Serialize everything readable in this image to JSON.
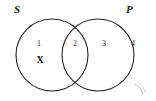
{
  "diagram": {
    "type": "venn-diagram",
    "title": "",
    "sets": [
      {
        "id": "S",
        "label": "S",
        "position": "left"
      },
      {
        "id": "P",
        "label": "P",
        "position": "right"
      }
    ],
    "regions": [
      {
        "id": "region-1",
        "number": "1",
        "meaning": "S only",
        "mark": "X"
      },
      {
        "id": "region-2",
        "number": "2",
        "meaning": "S and P intersection",
        "mark": ""
      },
      {
        "id": "region-3",
        "number": "3",
        "meaning": "P only",
        "mark": ""
      },
      {
        "id": "region-4",
        "number": "4",
        "meaning": "outside both sets",
        "mark": ""
      }
    ],
    "marks": [
      {
        "symbol": "X",
        "region": "1"
      }
    ],
    "colors": {
      "stroke": "#262626",
      "background": "#ffffff",
      "text": "#1a1a1a",
      "number": "#333333",
      "artifact": "#c9c9c9"
    },
    "geometry": {
      "left_circle": {
        "cx": 52,
        "cy": 55,
        "r": 36
      },
      "right_circle": {
        "cx": 98,
        "cy": 55,
        "r": 36
      }
    },
    "artifact": {
      "name": "scanner-smudge",
      "position": "bottom-right"
    }
  }
}
